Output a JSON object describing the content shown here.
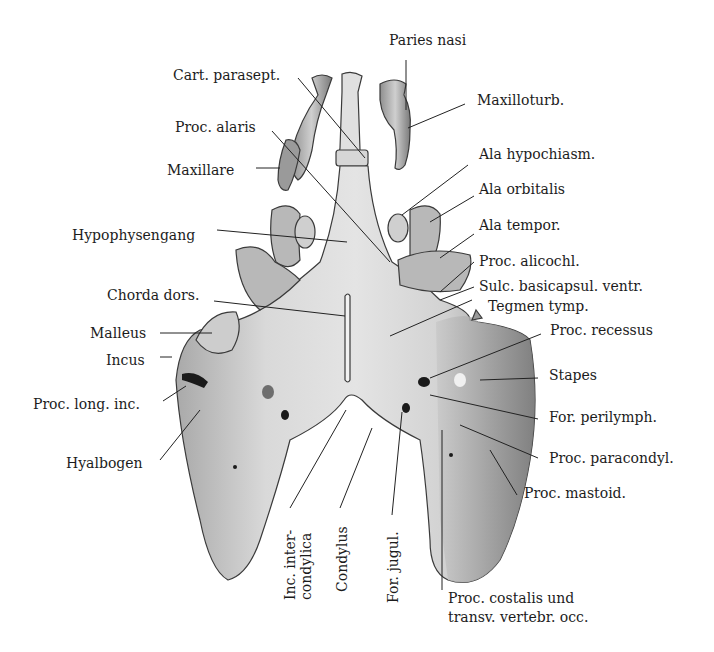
{
  "figure": {
    "type": "anatomical illustration",
    "colors": {
      "cartilage_light": "#e2e2e2",
      "cartilage_mid": "#bdbdbd",
      "cartilage_dark": "#7a7a7a",
      "foramen": "#1a1a1a",
      "leader_line": "#222222"
    }
  },
  "labels": {
    "paries_nasi": "Paries nasi",
    "cart_parasept": "Cart. parasept.",
    "maxilloturb": "Maxilloturb.",
    "proc_alaris": "Proc. alaris",
    "maxillare": "Maxillare",
    "ala_hypochiasm": "Ala hypochiasm.",
    "ala_orbitalis": "Ala orbitalis",
    "hypophysengang": "Hypophysengang",
    "ala_tempor": "Ala tempor.",
    "proc_alicochl": "Proc. alicochl.",
    "sulc_basicapsul": "Sulc. basicapsul. ventr.",
    "chorda_dors": "Chorda dors.",
    "tegmen_tymp": "Tegmen tymp.",
    "malleus": "Malleus",
    "proc_recessus": "Proc. recessus",
    "incus": "Incus",
    "stapes": "Stapes",
    "proc_long_inc": "Proc. long. inc.",
    "for_perilymph": "For. perilymph.",
    "proc_paracondyl": "Proc. paracondyl.",
    "hyalbogen": "Hyalbogen",
    "proc_mastoid": "Proc. mastoid.",
    "inc_intercondylica_1": "Inc. inter-",
    "inc_intercondylica_2": "condylica",
    "condylus": "Condylus",
    "for_jugul": "For. jugul.",
    "proc_costalis_1": "Proc. costalis und",
    "proc_costalis_2": "transv. vertebr. occ."
  }
}
